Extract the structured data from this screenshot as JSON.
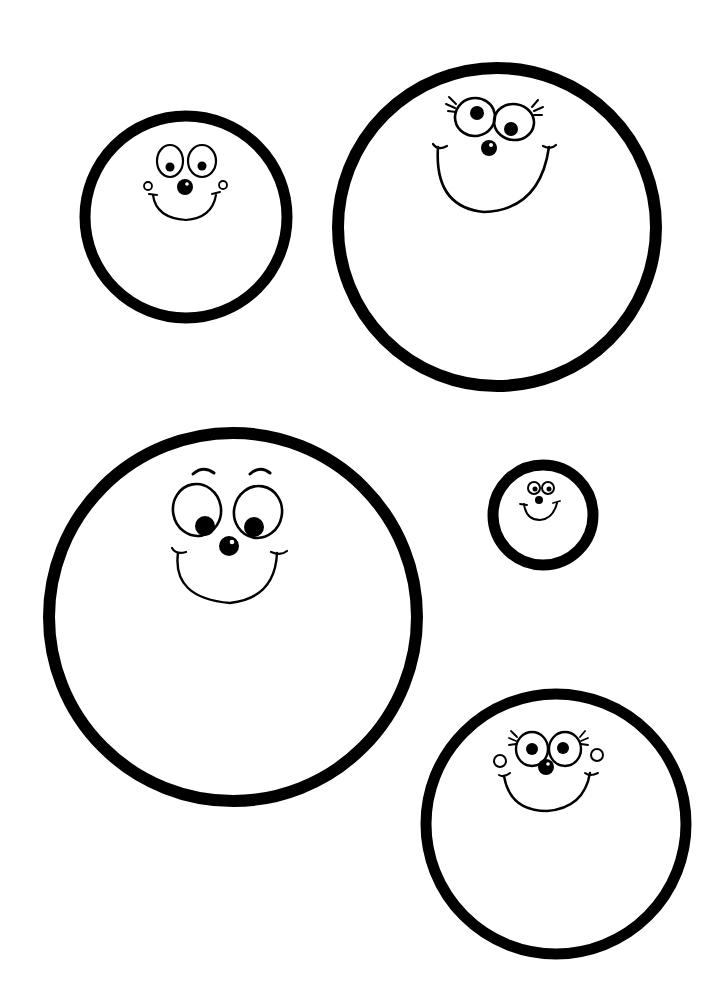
{
  "page": {
    "title": "Smiley face circles",
    "background": "#ffffff",
    "ink": "#000000"
  },
  "faces": [
    {
      "label": "Small circle with round-eyed smiling face and cheek dots",
      "size": "small",
      "style": "cheeks"
    },
    {
      "label": "Large circle with eyelashed smiling face",
      "size": "large",
      "style": "eyelashes"
    },
    {
      "label": "Large circle with eyebrowed face looking down",
      "size": "extra-large",
      "style": "eyebrows"
    },
    {
      "label": "Tiny circle with small smiling face",
      "size": "tiny",
      "style": "plain"
    },
    {
      "label": "Medium circle with eyelashed smiling face and cheek dots",
      "size": "medium",
      "style": "eyelashes-cheeks"
    }
  ]
}
